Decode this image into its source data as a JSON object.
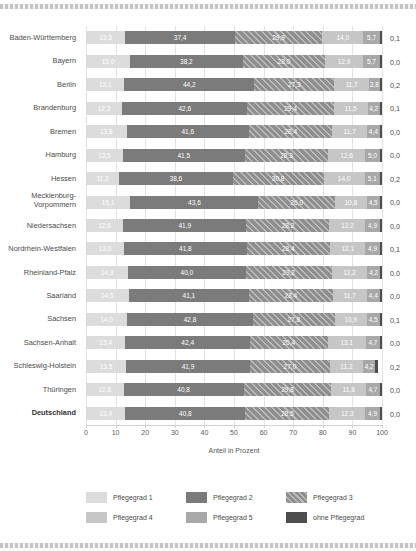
{
  "chart_data": {
    "type": "bar",
    "subtype": "stacked-horizontal-100",
    "title": "",
    "xlabel": "Anteil in Prozent",
    "ylabel": "",
    "xlim": [
      0,
      100
    ],
    "xticks": [
      0,
      10,
      20,
      30,
      40,
      50,
      60,
      70,
      80,
      90,
      100
    ],
    "xtick_labels": [
      "0",
      "10",
      "20",
      "30",
      "40",
      "50",
      "60",
      "70",
      "80",
      "90",
      "100"
    ],
    "grid": true,
    "legend_position": "bottom",
    "categories": [
      "Baden-Württemberg",
      "Bayern",
      "Berlin",
      "Brandenburg",
      "Bremen",
      "Hamburg",
      "Hessen",
      "Mecklenburg-\nVorpommern",
      "Niedersachsen",
      "Nordrhein-Westfalen",
      "Rheinland-Pfalz",
      "Saarland",
      "Sachsen",
      "Sachsen-Anhalt",
      "Schleswig-Holstein",
      "Thüringen",
      "Deutschland"
    ],
    "series": [
      {
        "name": "Pflegegrad 1",
        "color": "#dcdcdc",
        "values": [
          13.5,
          15.0,
          13.1,
          12.3,
          13.8,
          12.5,
          11.2,
          15.1,
          12.6,
          13.0,
          14.3,
          14.5,
          14.0,
          13.4,
          13.5,
          12.8,
          13.4
        ],
        "labels": [
          "13,5",
          "15,0",
          "13,1",
          "12,3",
          "13,8",
          "12,5",
          "11,2",
          "15,1",
          "12,6",
          "13,0",
          "14,3",
          "14,5",
          "14,0",
          "13,4",
          "13,5",
          "12,8",
          "13,4"
        ]
      },
      {
        "name": "Pflegegrad 2",
        "color": "#7b7b7b",
        "values": [
          37.4,
          38.2,
          44.2,
          42.6,
          41.6,
          41.5,
          38.6,
          43.6,
          41.9,
          41.8,
          40.0,
          41.1,
          42.8,
          42.4,
          41.9,
          40.8,
          40.8
        ],
        "labels": [
          "37,4",
          "38,2",
          "44,2",
          "42,6",
          "41,6",
          "41,5",
          "38,6",
          "43,6",
          "41,9",
          "41,8",
          "40,0",
          "41,1",
          "42,8",
          "42,4",
          "41,9",
          "40,8",
          "40,8"
        ]
      },
      {
        "name": "Pflegegrad 3",
        "color": "#8e8e8e",
        "hatch": "diagonal",
        "values": [
          29.9,
          28.0,
          27.3,
          29.4,
          28.4,
          28.3,
          30.8,
          26.0,
          28.2,
          28.4,
          29.2,
          28.4,
          27.8,
          26.4,
          27.0,
          29.8,
          28.5
        ],
        "labels": [
          "29,9",
          "28,0",
          "27,3",
          "29,4",
          "28,4",
          "28,3",
          "30,8",
          "26,0",
          "28,2",
          "28,4",
          "29,2",
          "28,4",
          "27,8",
          "26,4",
          "27,0",
          "29,8",
          "28,5"
        ]
      },
      {
        "name": "Pflegegrad 4",
        "color": "#c6c6c6",
        "values": [
          14.0,
          12.9,
          11.7,
          11.5,
          11.7,
          12.6,
          14.0,
          10.8,
          12.2,
          12.1,
          12.2,
          11.7,
          10.9,
          13.1,
          11.2,
          11.8,
          12.3
        ],
        "labels": [
          "14,0",
          "12,9",
          "11,7",
          "11,5",
          "11,7",
          "12,6",
          "14,0",
          "10,8",
          "12,2",
          "12,1",
          "12,2",
          "11,7",
          "10,9",
          "13,1",
          "11,2",
          "11,8",
          "12,3"
        ]
      },
      {
        "name": "Pflegegrad 5",
        "color": "#a8a8a8",
        "values": [
          5.7,
          5.7,
          3.8,
          4.2,
          4.4,
          5.0,
          5.1,
          4.5,
          4.9,
          4.9,
          4.2,
          4.4,
          4.5,
          4.7,
          4.2,
          4.7,
          4.9
        ],
        "labels": [
          "5,7",
          "5,7",
          "3,8",
          "4,2",
          "4,4",
          "5,0",
          "5,1",
          "4,5",
          "4,9",
          "4,9",
          "4,2",
          "4,4",
          "4,5",
          "4,7",
          "4,2",
          "4,7",
          "4,9"
        ]
      },
      {
        "name": "ohne Pflegegrad",
        "color": "#4d4d4d",
        "values": [
          0.1,
          0.0,
          0.2,
          0.1,
          0.0,
          0.0,
          0.2,
          0.0,
          0.0,
          0.1,
          0.0,
          0.0,
          0.1,
          0.0,
          0.2,
          0.0,
          0.0
        ],
        "labels": [
          "0,1",
          "0,0",
          "0,2",
          "0,1",
          "0,0",
          "0,0",
          "0,2",
          "0,0",
          "0,0",
          "0,1",
          "0,0",
          "0,0",
          "0,1",
          "0,0",
          "0,2",
          "0,0",
          "0,0"
        ]
      }
    ],
    "outside_labels": [
      "0,1",
      "0,0",
      "0,2",
      "0,1",
      "0,0",
      "0,0",
      "0,2",
      "0,0",
      "0,0",
      "0,1",
      "0,0",
      "0,0",
      "0,1",
      "0,0",
      "0,2",
      "0,0",
      "0,0"
    ],
    "bold_categories": [
      "Deutschland"
    ]
  },
  "legend": {
    "items": [
      {
        "label": "Pflegegrad 1",
        "color": "#dcdcdc"
      },
      {
        "label": "Pflegegrad 2",
        "color": "#7b7b7b"
      },
      {
        "label": "Pflegegrad 3",
        "color": "#8e8e8e"
      },
      {
        "label": "Pflegegrad 4",
        "color": "#c6c6c6"
      },
      {
        "label": "Pflegegrad 5",
        "color": "#a8a8a8"
      },
      {
        "label": "ohne Pflegegrad",
        "color": "#4d4d4d"
      }
    ]
  },
  "axis": {
    "title": "Anteil in Prozent"
  }
}
